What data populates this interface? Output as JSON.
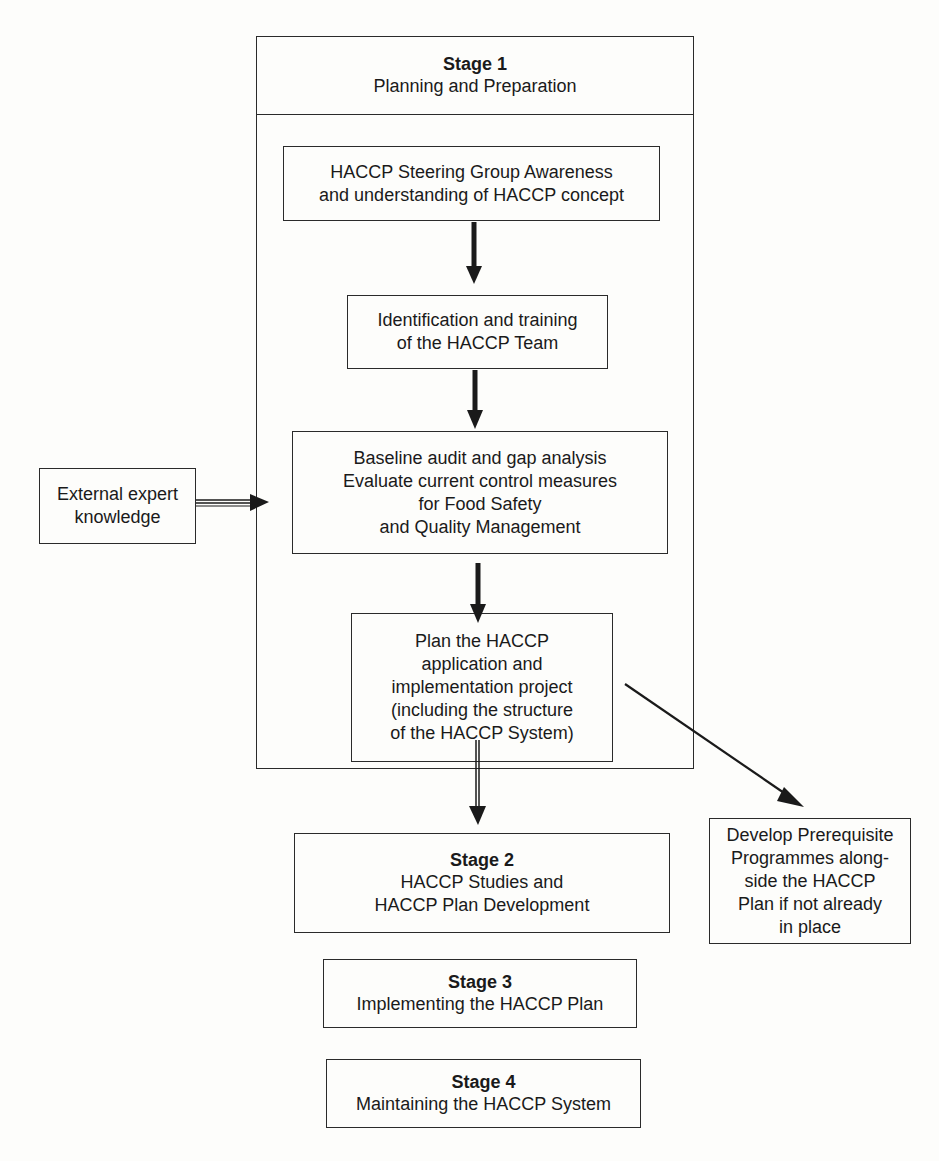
{
  "diagram": {
    "stage1": {
      "title": "Stage 1",
      "subtitle": "Planning and Preparation",
      "steps": [
        {
          "lines": [
            "HACCP Steering Group Awareness",
            "and understanding of HACCP concept"
          ]
        },
        {
          "lines": [
            "Identification and training",
            "of the HACCP Team"
          ]
        },
        {
          "lines": [
            "Baseline audit and gap analysis",
            "Evaluate current control measures",
            "for Food Safety",
            "and Quality Management"
          ]
        },
        {
          "lines": [
            "Plan the HACCP",
            "application and",
            "implementation project",
            "(including the structure",
            "of the HACCP System)"
          ]
        }
      ]
    },
    "external_input": {
      "lines": [
        "External expert",
        "knowledge"
      ]
    },
    "side_output": {
      "lines": [
        "Develop Prerequisite",
        "Programmes along-",
        "side the HACCP",
        "Plan if not already",
        "in place"
      ]
    },
    "stage2": {
      "title": "Stage 2",
      "lines": [
        "HACCP Studies and",
        "HACCP Plan Development"
      ]
    },
    "stage3": {
      "title": "Stage 3",
      "lines": [
        "Implementing the HACCP Plan"
      ]
    },
    "stage4": {
      "title": "Stage 4",
      "lines": [
        "Maintaining the HACCP System"
      ]
    },
    "colors": {
      "line": "#2a2a2a",
      "background": "#fdfdfb",
      "text": "#1a1a1a"
    }
  }
}
